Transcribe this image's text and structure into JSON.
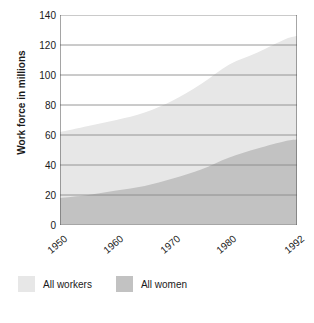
{
  "chart_data": {
    "type": "area",
    "title": "",
    "subtitle": "",
    "xlabel": "",
    "ylabel": "Work force in millions",
    "xlim": [
      1950,
      1992
    ],
    "ylim": [
      0,
      140
    ],
    "grid": true,
    "legend_position": "bottom-left",
    "x_tick_labels": [
      "1950",
      "1960",
      "1970",
      "1980",
      "1992"
    ],
    "x_ticks": [
      1950,
      1960,
      1970,
      1980,
      1992
    ],
    "y_tick_labels": [
      "0",
      "20",
      "40",
      "60",
      "80",
      "100",
      "120",
      "140"
    ],
    "y_ticks": [
      0,
      20,
      40,
      60,
      80,
      100,
      120,
      140
    ],
    "x": [
      1950,
      1955,
      1960,
      1965,
      1970,
      1975,
      1980,
      1985,
      1990,
      1992
    ],
    "series": [
      {
        "name": "All workers",
        "color": "#e7e7e7",
        "values": [
          62,
          66,
          70,
          75,
          83,
          94,
          107,
          115,
          124,
          126
        ]
      },
      {
        "name": "All women",
        "color": "#c2c2c2",
        "values": [
          18,
          20,
          23,
          26,
          31,
          37,
          45,
          51,
          56,
          57
        ]
      }
    ]
  },
  "axis": {
    "y_title": "Work force in millions",
    "y_labels": [
      "140",
      "120",
      "100",
      "80",
      "60",
      "40",
      "20",
      "0"
    ],
    "x_labels": [
      "1950",
      "1960",
      "1970",
      "1980",
      "1992"
    ]
  },
  "legend": {
    "items": [
      {
        "label": "All workers",
        "color": "#e7e7e7"
      },
      {
        "label": "All women",
        "color": "#c2c2c2"
      }
    ]
  },
  "colors": {
    "all_workers": "#e7e7e7",
    "all_women": "#c2c2c2",
    "gridline": "#8a8a8a",
    "axis": "#4d4d4d",
    "text": "#1a1a1a"
  }
}
